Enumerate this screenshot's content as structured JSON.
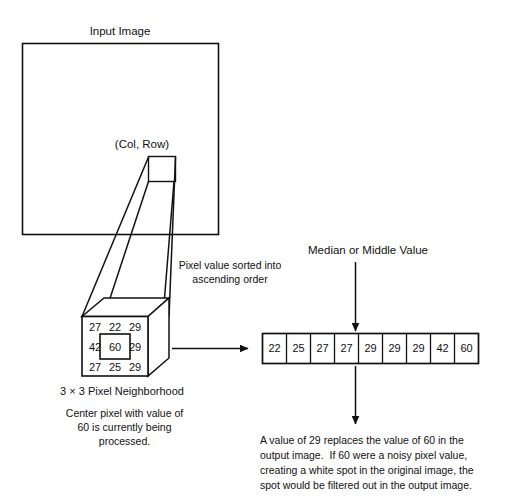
{
  "figure": {
    "title_input_image": "Input Image",
    "label_col_row": "(Col, Row)",
    "label_sorted": "Pixel value sorted into\nascending order",
    "label_median": "Median or Middle Value",
    "caption_neighborhood": "3 × 3 Pixel Neighborhood",
    "caption_center_pixel": "Center pixel with value of\n60 is currently being\nprocessed.",
    "caption_result": "A value of 29 replaces the value of 60 in the\noutput image.  If 60 were a noisy pixel value,\ncreating a white spot in the original image, the\nspot would be filtered out in the output image."
  },
  "neighborhood": {
    "rows": [
      [
        "27",
        "22",
        "29"
      ],
      [
        "42",
        "60",
        "29"
      ],
      [
        "27",
        "25",
        "29"
      ]
    ],
    "center_value": "60"
  },
  "sorted_array": {
    "values": [
      "22",
      "25",
      "27",
      "27",
      "29",
      "29",
      "29",
      "42",
      "60"
    ],
    "median_index": 4,
    "median_value": "29"
  },
  "colors": {
    "stroke": "#111111",
    "background": "#ffffff",
    "text": "#111111"
  }
}
